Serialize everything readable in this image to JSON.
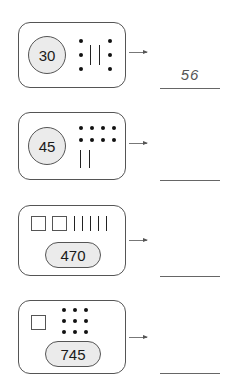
{
  "problems": [
    {
      "id": 1,
      "number_label": "30",
      "number_shape": "circle",
      "models": {
        "hundreds_squares": 0,
        "tens_tallies": 2,
        "ones_dots": 6
      },
      "answer": "56"
    },
    {
      "id": 2,
      "number_label": "45",
      "number_shape": "circle",
      "models": {
        "hundreds_squares": 0,
        "tens_tallies": 2,
        "ones_dots": 8
      },
      "answer": ""
    },
    {
      "id": 3,
      "number_label": "470",
      "number_shape": "pill",
      "models": {
        "hundreds_squares": 2,
        "tens_tallies": 5,
        "ones_dots": 0
      },
      "answer": ""
    },
    {
      "id": 4,
      "number_label": "745",
      "number_shape": "pill",
      "models": {
        "hundreds_squares": 1,
        "tens_tallies": 0,
        "ones_dots": 9
      },
      "answer": ""
    }
  ],
  "colors": {
    "number_fill": "#ebebeb",
    "border": "#555555",
    "answer_text": "#555555"
  }
}
